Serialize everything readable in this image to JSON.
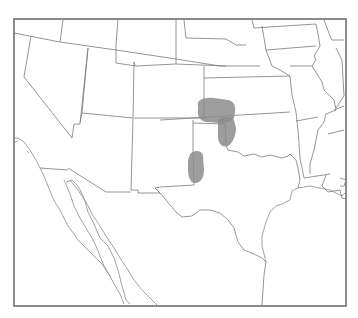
{
  "map": {
    "type": "outline-map",
    "region": "South-central and southwestern United States with northern Mexico",
    "colors": {
      "background": "#ffffff",
      "border": "#7a7a7a",
      "frame": "#6e6e6e",
      "shaded_region": "#8c8c8c"
    },
    "shaded_regions": [
      {
        "id": "region-1",
        "location": "southwestern Kansas / southeastern Colorado"
      },
      {
        "id": "region-2",
        "location": "western Oklahoma / Texas panhandle border"
      },
      {
        "id": "region-3",
        "location": "eastern New Mexico near Texas border"
      }
    ]
  }
}
